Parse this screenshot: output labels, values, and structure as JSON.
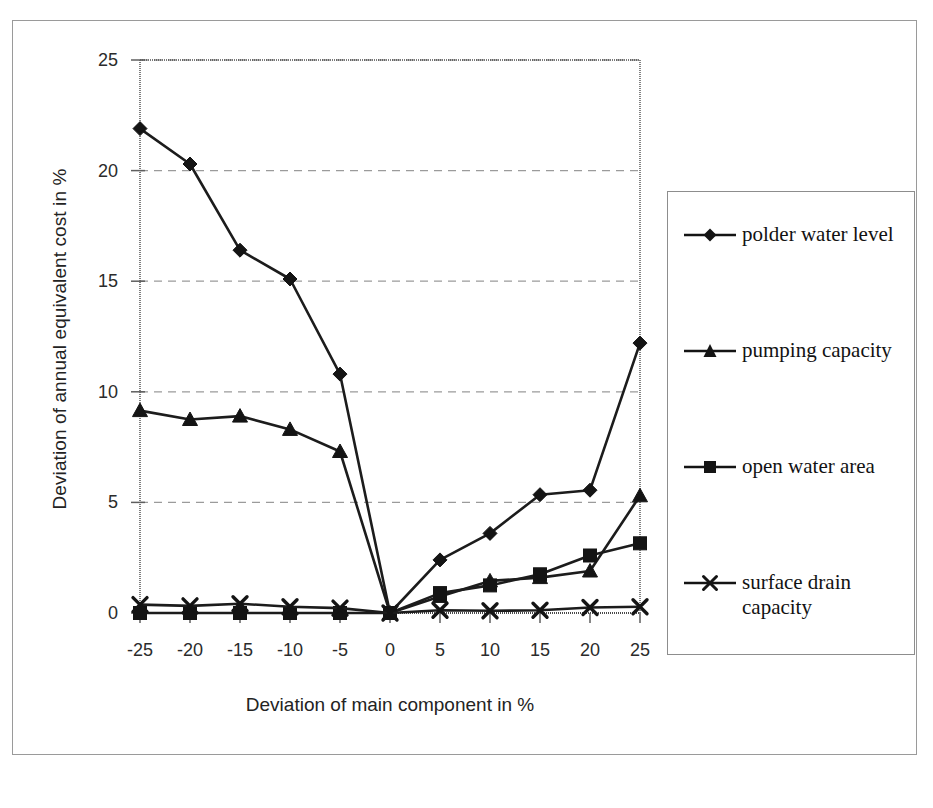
{
  "chart_data": {
    "type": "line",
    "title": "",
    "xlabel": "Deviation of main component in %",
    "ylabel": "Deviation of annual equivalent cost in %",
    "x": [
      -25,
      -20,
      -15,
      -10,
      -5,
      0,
      5,
      10,
      15,
      20,
      25
    ],
    "xtick_labels": [
      "-25",
      "-20",
      "-15",
      "-10",
      "-5",
      "0",
      "5",
      "10",
      "15",
      "20",
      "25"
    ],
    "ytick_labels": [
      "0",
      "5",
      "10",
      "15",
      "20",
      "25"
    ],
    "yticks": [
      0,
      5,
      10,
      15,
      20,
      25
    ],
    "xlim": [
      -25,
      25
    ],
    "ylim": [
      0,
      25
    ],
    "grid": "horizontal-dashed",
    "legend_position": "right",
    "series": [
      {
        "name": "polder water level",
        "marker": "diamond",
        "values": [
          21.9,
          20.3,
          16.4,
          15.1,
          10.8,
          0.0,
          2.4,
          3.6,
          5.35,
          5.55,
          12.2
        ]
      },
      {
        "name": "pumping capacity",
        "marker": "triangle",
        "values": [
          9.15,
          8.75,
          8.9,
          8.3,
          7.3,
          0.0,
          0.75,
          1.45,
          1.6,
          1.9,
          5.3
        ]
      },
      {
        "name": "open water area",
        "marker": "square",
        "values": [
          0.0,
          0.0,
          0.0,
          0.0,
          0.0,
          0.0,
          0.9,
          1.25,
          1.75,
          2.6,
          3.15
        ]
      },
      {
        "name": "surface drain capacity",
        "marker": "cross",
        "values": [
          0.38,
          0.32,
          0.42,
          0.28,
          0.22,
          0.0,
          0.12,
          0.1,
          0.12,
          0.25,
          0.28
        ]
      }
    ]
  },
  "legend": {
    "entries": [
      {
        "label": "polder water level",
        "marker": "diamond-marker"
      },
      {
        "label": "pumping capacity",
        "marker": "triangle-marker"
      },
      {
        "label": "open water area",
        "marker": "square-marker"
      },
      {
        "label": "surface drain capacity",
        "marker": "cross-marker"
      }
    ]
  },
  "colors": {
    "series_line": "#1c1c1c",
    "grid": "#9b9b9b",
    "axis": "#5e5e5e",
    "frame": "#9a9a9a",
    "text": "#232323",
    "background": "#ffffff"
  }
}
